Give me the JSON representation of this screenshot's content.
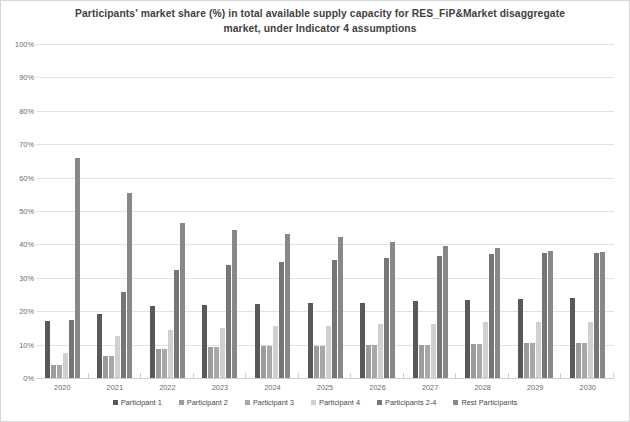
{
  "chart_data": {
    "type": "bar",
    "title": "Participants' market share (%) in total available supply capacity for RES_FiP&Market  disaggregate market, under Indicator 4 assumptions",
    "title_line1": "Participants' market share (%) in total available supply capacity for RES_FiP&Market  disaggregate",
    "title_line2": "market, under Indicator 4 assumptions",
    "xlabel": "",
    "ylabel": "",
    "ylim": [
      0,
      100
    ],
    "ytick_step": 10,
    "grid": true,
    "legend_position": "bottom",
    "categories": [
      "2020",
      "2021",
      "2022",
      "2023",
      "2024",
      "2025",
      "2026",
      "2027",
      "2028",
      "2029",
      "2030"
    ],
    "ytick_labels": [
      "100%",
      "90%",
      "80%",
      "70%",
      "60%",
      "50%",
      "40%",
      "30%",
      "20%",
      "10%",
      "0%"
    ],
    "ytick_values": [
      100,
      90,
      80,
      70,
      60,
      50,
      40,
      30,
      20,
      10,
      0
    ],
    "series": [
      {
        "name": "Participant 1",
        "color": "#595959",
        "values": [
          17.0,
          19.3,
          21.7,
          21.8,
          22.2,
          22.5,
          22.6,
          23.0,
          23.4,
          23.8,
          24.0
        ]
      },
      {
        "name": "Participant 2",
        "color": "#9c9c9c",
        "values": [
          3.8,
          6.5,
          8.8,
          9.4,
          9.6,
          9.7,
          9.9,
          10.0,
          10.2,
          10.4,
          10.4
        ]
      },
      {
        "name": "Participant 3",
        "color": "#a8a8a8",
        "values": [
          3.8,
          6.5,
          8.8,
          9.4,
          9.6,
          9.7,
          9.9,
          10.0,
          10.2,
          10.4,
          10.4
        ]
      },
      {
        "name": "Participant 4",
        "color": "#d0d0d0",
        "values": [
          7.5,
          12.7,
          14.4,
          15.0,
          15.6,
          15.7,
          16.2,
          16.3,
          16.7,
          16.8,
          16.7
        ]
      },
      {
        "name": "Participants 2-4",
        "color": "#767676",
        "values": [
          17.5,
          25.8,
          32.2,
          33.8,
          34.7,
          35.2,
          35.9,
          36.4,
          37.1,
          37.5,
          37.5
        ]
      },
      {
        "name": "Rest Participants",
        "color": "#888888",
        "values": [
          65.8,
          55.3,
          46.5,
          44.3,
          43.0,
          42.2,
          40.7,
          39.5,
          38.8,
          38.1,
          37.8
        ]
      }
    ]
  },
  "legend": {
    "items": [
      {
        "label": "Participant 1",
        "color": "#595959"
      },
      {
        "label": "Participant 2",
        "color": "#9c9c9c"
      },
      {
        "label": "Participant 3",
        "color": "#a8a8a8"
      },
      {
        "label": "Participant 4",
        "color": "#d0d0d0"
      },
      {
        "label": "Participants 2-4",
        "color": "#767676"
      },
      {
        "label": "Rest Participants",
        "color": "#888888"
      }
    ]
  },
  "colors": {
    "background": "#ffffff",
    "gridline": "#e2e2e2",
    "axis": "#cfcfcf",
    "title_text": "#3f3f3f",
    "tick_text": "#6b6b6b",
    "legend_text": "#4a4a4a"
  }
}
